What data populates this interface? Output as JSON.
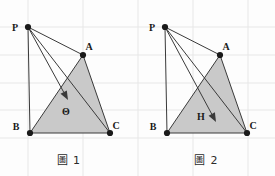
{
  "document": {
    "kind": "geometry-figure-pair",
    "background_color": "#fdfdfd"
  },
  "style": {
    "triangle_fill": "#c9c9c9",
    "triangle_stroke": "#4a4a4a",
    "line_color": "#3a3a3a",
    "grid_color": "#e7e7e7",
    "vertex_dot_color": "#1a1a1a",
    "label_color": "#1a1a1a",
    "caption_color": "#2b2b2b"
  },
  "grid": {
    "visible": true,
    "vertical_x": [
      28,
      83,
      138,
      193,
      248
    ],
    "horizontal_y": [
      27,
      55,
      83,
      110,
      138
    ]
  },
  "figures": [
    {
      "id": "figure-1",
      "caption": "圖 1",
      "points": {
        "P": {
          "label": "P",
          "x": 28,
          "y": 27,
          "label_dx": -13,
          "label_dy": 4
        },
        "A": {
          "label": "A",
          "x": 83,
          "y": 55,
          "label_dx": 6,
          "label_dy": -5
        },
        "B": {
          "label": "B",
          "x": 30,
          "y": 133,
          "label_dx": -14,
          "label_dy": -3
        },
        "C": {
          "label": "C",
          "x": 110,
          "y": 133,
          "label_dx": 6,
          "label_dy": -4
        },
        "M": {
          "label": "Θ",
          "x": 68,
          "y": 100,
          "label_dx": -2,
          "label_dy": 15
        }
      },
      "triangle": [
        "A",
        "B",
        "C"
      ],
      "segments": [
        {
          "from": "P",
          "to": "A",
          "name": "segment-pa"
        },
        {
          "from": "P",
          "to": "B",
          "name": "segment-pb"
        },
        {
          "from": "P",
          "to": "C",
          "name": "segment-pc"
        },
        {
          "from": "A",
          "to": "B",
          "name": "segment-ab"
        },
        {
          "from": "B",
          "to": "C",
          "name": "segment-bc"
        },
        {
          "from": "C",
          "to": "A",
          "name": "segment-ca"
        }
      ],
      "arrow": {
        "from": "P",
        "to": "M",
        "name": "pointer-arrow-theta",
        "points_to_label": "Θ"
      }
    },
    {
      "id": "figure-2",
      "caption": "圖 2",
      "points": {
        "P": {
          "label": "P",
          "x": 165,
          "y": 27,
          "label_dx": -13,
          "label_dy": 4
        },
        "A": {
          "label": "A",
          "x": 220,
          "y": 55,
          "label_dx": 6,
          "label_dy": -5
        },
        "B": {
          "label": "B",
          "x": 167,
          "y": 133,
          "label_dx": -14,
          "label_dy": -3
        },
        "C": {
          "label": "C",
          "x": 247,
          "y": 133,
          "label_dx": 6,
          "label_dy": -4
        },
        "M": {
          "label": "H",
          "x": 216,
          "y": 122,
          "label_dx": -15,
          "label_dy": -2
        }
      },
      "triangle": [
        "A",
        "B",
        "C"
      ],
      "segments": [
        {
          "from": "P",
          "to": "A",
          "name": "segment-pa"
        },
        {
          "from": "P",
          "to": "B",
          "name": "segment-pb"
        },
        {
          "from": "P",
          "to": "C",
          "name": "segment-pc"
        },
        {
          "from": "A",
          "to": "B",
          "name": "segment-ab"
        },
        {
          "from": "B",
          "to": "C",
          "name": "segment-bc"
        },
        {
          "from": "C",
          "to": "A",
          "name": "segment-ca"
        }
      ],
      "arrow": {
        "from": "P",
        "to": "M",
        "name": "pointer-arrow-h",
        "points_to_label": "H"
      }
    }
  ]
}
